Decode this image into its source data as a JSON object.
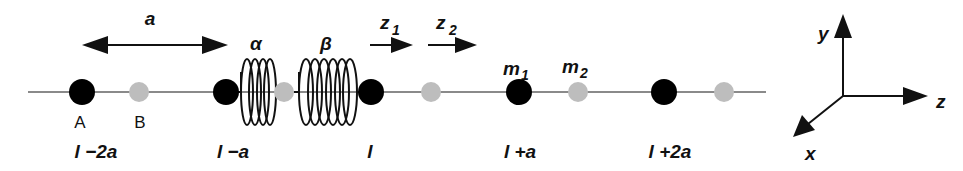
{
  "figure": {
    "type": "diatomic-chain-diagram",
    "colors": {
      "atom_A": "#000000",
      "atom_B": "#bdbdbd",
      "chain_line": "#8a8a8a",
      "ink": "#111111"
    }
  },
  "spacing_arrow": {
    "label": "a"
  },
  "springs": [
    {
      "id": "alpha",
      "label": "α"
    },
    {
      "id": "beta",
      "label": "β"
    }
  ],
  "displacements": [
    {
      "id": "z1",
      "label": "z",
      "sub": "1"
    },
    {
      "id": "z2",
      "label": "z",
      "sub": "2"
    }
  ],
  "atom_labels": {
    "A": "A",
    "B": "B"
  },
  "mass_labels": [
    {
      "id": "m1",
      "label": "m",
      "sub": "1"
    },
    {
      "id": "m2",
      "label": "m",
      "sub": "2"
    }
  ],
  "positions": [
    {
      "id": "l-2a",
      "label": "l −2a"
    },
    {
      "id": "l-a",
      "label": "l −a"
    },
    {
      "id": "l",
      "label": "l"
    },
    {
      "id": "l+a",
      "label": "l +a"
    },
    {
      "id": "l+2a",
      "label": "l +2a"
    }
  ],
  "axes": {
    "x": "x",
    "y": "y",
    "z": "z"
  }
}
